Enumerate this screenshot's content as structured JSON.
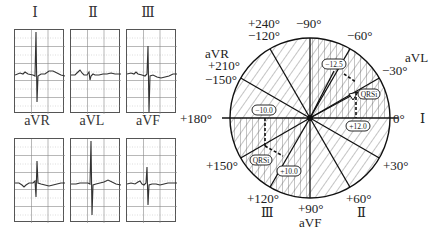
{
  "ecg_leads": {
    "limb": [
      {
        "name": "I",
        "label": "Ⅰ"
      },
      {
        "name": "II",
        "label": "Ⅱ"
      },
      {
        "name": "III",
        "label": "Ⅲ"
      }
    ],
    "augmented": [
      {
        "name": "aVR",
        "label": "aVR"
      },
      {
        "name": "aVL",
        "label": "aVL"
      },
      {
        "name": "aVF",
        "label": "aVF"
      }
    ]
  },
  "hexaxial": {
    "angle_labels": {
      "deg_0": "0°",
      "lead_I": "Ⅰ",
      "neg30": "−30°",
      "aVL": "aVL",
      "neg60": "−60°",
      "neg90": "−90°",
      "plus240": "+240°",
      "neg120": "−120°",
      "aVR": "aVR",
      "plus210": "+210°",
      "neg150": "−150°",
      "plus180": "+180°",
      "plus150": "+150°",
      "plus120": "+120°",
      "lead_III": "Ⅲ",
      "plus90": "+90°",
      "aVF": "aVF",
      "plus60": "+60°",
      "lead_II": "Ⅱ",
      "plus30": "+30°"
    },
    "vector_labels": {
      "upper_value": "−12.5",
      "upper_qrs": "QRSi",
      "upper_right_value": "+12.0",
      "lower_left_value": "−10.0",
      "lower_qrs": "QRSi",
      "lower_value": "+10.0"
    }
  }
}
